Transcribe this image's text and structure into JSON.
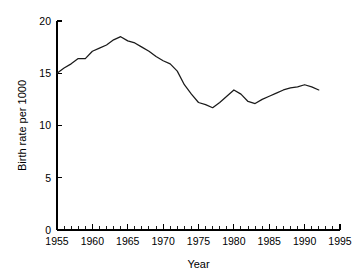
{
  "chart_data": {
    "type": "line",
    "title": "",
    "subtitle": "",
    "xlabel": "Year",
    "ylabel": "Birth rate per 1000",
    "xlim": [
      1955,
      1995
    ],
    "ylim": [
      0,
      20
    ],
    "grid": false,
    "legend": null,
    "legend_position": "none",
    "x_ticks": [
      1955,
      1960,
      1965,
      1970,
      1975,
      1980,
      1985,
      1990,
      1995
    ],
    "x_tick_labels": [
      "1955",
      "1960",
      "1965",
      "1970",
      "1975",
      "1980",
      "1985",
      "1990",
      "1995"
    ],
    "x_minor_tick_step": 1,
    "y_ticks": [
      0,
      5,
      10,
      15,
      20
    ],
    "y_tick_labels": [
      "0",
      "5",
      "10",
      "15",
      "20"
    ],
    "series": [
      {
        "name": "Birth rate per 1000",
        "color": "#1a1a1a",
        "x": [
          1955,
          1956,
          1957,
          1958,
          1959,
          1960,
          1961,
          1962,
          1963,
          1964,
          1965,
          1966,
          1967,
          1968,
          1969,
          1970,
          1971,
          1972,
          1973,
          1974,
          1975,
          1976,
          1977,
          1978,
          1979,
          1980,
          1981,
          1982,
          1983,
          1984,
          1985,
          1986,
          1987,
          1988,
          1989,
          1990,
          1991,
          1992
        ],
        "values": [
          15.0,
          15.5,
          15.9,
          16.4,
          16.4,
          17.1,
          17.4,
          17.7,
          18.2,
          18.5,
          18.1,
          17.9,
          17.5,
          17.1,
          16.6,
          16.2,
          15.9,
          15.2,
          13.9,
          13.0,
          12.2,
          12.0,
          11.7,
          12.2,
          12.8,
          13.4,
          13.0,
          12.3,
          12.1,
          12.5,
          12.8,
          13.1,
          13.4,
          13.6,
          13.7,
          13.9,
          13.7,
          13.4
        ]
      }
    ]
  },
  "axes": {
    "x_title": "Year",
    "y_title": "Birth rate per 1000"
  }
}
